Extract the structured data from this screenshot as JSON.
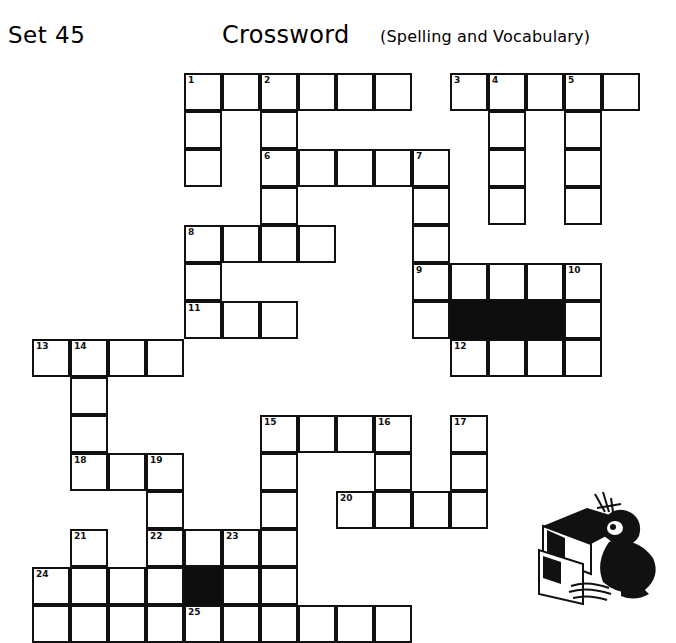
{
  "header": {
    "set_label": "Set 45",
    "title": "Crossword",
    "subtitle": "(Spelling and Vocabulary)"
  },
  "grid": {
    "cell_size": 38,
    "origin_x": 32,
    "origin_y": 73,
    "columns": 16,
    "rows": 15,
    "colors": {
      "cell_fill": "#ffffff",
      "cell_border": "#111111",
      "blocked_fill": "#0d0d0d",
      "page_background": "#ffffff"
    },
    "clue_numbers": [
      1,
      2,
      3,
      4,
      5,
      6,
      7,
      8,
      9,
      10,
      11,
      12,
      13,
      14,
      15,
      16,
      17,
      18,
      19,
      20,
      21,
      22,
      23,
      24,
      25
    ],
    "cells": [
      {
        "col": 4,
        "row": 0,
        "num": "1"
      },
      {
        "col": 5,
        "row": 0,
        "num": ""
      },
      {
        "col": 6,
        "row": 0,
        "num": "2"
      },
      {
        "col": 7,
        "row": 0,
        "num": ""
      },
      {
        "col": 8,
        "row": 0,
        "num": ""
      },
      {
        "col": 9,
        "row": 0,
        "num": ""
      },
      {
        "col": 11,
        "row": 0,
        "num": "3"
      },
      {
        "col": 12,
        "row": 0,
        "num": "4"
      },
      {
        "col": 13,
        "row": 0,
        "num": ""
      },
      {
        "col": 14,
        "row": 0,
        "num": "5"
      },
      {
        "col": 15,
        "row": 0,
        "num": ""
      },
      {
        "col": 4,
        "row": 1,
        "num": ""
      },
      {
        "col": 6,
        "row": 1,
        "num": ""
      },
      {
        "col": 12,
        "row": 1,
        "num": ""
      },
      {
        "col": 14,
        "row": 1,
        "num": ""
      },
      {
        "col": 4,
        "row": 2,
        "num": ""
      },
      {
        "col": 6,
        "row": 2,
        "num": "6"
      },
      {
        "col": 7,
        "row": 2,
        "num": ""
      },
      {
        "col": 8,
        "row": 2,
        "num": ""
      },
      {
        "col": 9,
        "row": 2,
        "num": ""
      },
      {
        "col": 10,
        "row": 2,
        "num": "7"
      },
      {
        "col": 12,
        "row": 2,
        "num": ""
      },
      {
        "col": 14,
        "row": 2,
        "num": ""
      },
      {
        "col": 6,
        "row": 3,
        "num": ""
      },
      {
        "col": 10,
        "row": 3,
        "num": ""
      },
      {
        "col": 12,
        "row": 3,
        "num": ""
      },
      {
        "col": 14,
        "row": 3,
        "num": ""
      },
      {
        "col": 4,
        "row": 4,
        "num": "8"
      },
      {
        "col": 5,
        "row": 4,
        "num": ""
      },
      {
        "col": 6,
        "row": 4,
        "num": ""
      },
      {
        "col": 7,
        "row": 4,
        "num": ""
      },
      {
        "col": 10,
        "row": 4,
        "num": ""
      },
      {
        "col": 4,
        "row": 5,
        "num": ""
      },
      {
        "col": 10,
        "row": 5,
        "num": "9"
      },
      {
        "col": 11,
        "row": 5,
        "num": ""
      },
      {
        "col": 12,
        "row": 5,
        "num": ""
      },
      {
        "col": 13,
        "row": 5,
        "num": ""
      },
      {
        "col": 14,
        "row": 5,
        "num": "10"
      },
      {
        "col": 4,
        "row": 6,
        "num": "11"
      },
      {
        "col": 5,
        "row": 6,
        "num": ""
      },
      {
        "col": 6,
        "row": 6,
        "num": ""
      },
      {
        "col": 10,
        "row": 6,
        "num": ""
      },
      {
        "col": 11,
        "row": 6,
        "num": "",
        "black": true
      },
      {
        "col": 12,
        "row": 6,
        "num": "",
        "black": true
      },
      {
        "col": 13,
        "row": 6,
        "num": "",
        "black": true
      },
      {
        "col": 14,
        "row": 6,
        "num": ""
      },
      {
        "col": 0,
        "row": 7,
        "num": "13"
      },
      {
        "col": 1,
        "row": 7,
        "num": "14"
      },
      {
        "col": 2,
        "row": 7,
        "num": ""
      },
      {
        "col": 3,
        "row": 7,
        "num": ""
      },
      {
        "col": 11,
        "row": 7,
        "num": "12"
      },
      {
        "col": 12,
        "row": 7,
        "num": ""
      },
      {
        "col": 13,
        "row": 7,
        "num": ""
      },
      {
        "col": 14,
        "row": 7,
        "num": ""
      },
      {
        "col": 1,
        "row": 8,
        "num": ""
      },
      {
        "col": 1,
        "row": 9,
        "num": ""
      },
      {
        "col": 6,
        "row": 9,
        "num": "15"
      },
      {
        "col": 7,
        "row": 9,
        "num": ""
      },
      {
        "col": 8,
        "row": 9,
        "num": ""
      },
      {
        "col": 9,
        "row": 9,
        "num": "16"
      },
      {
        "col": 11,
        "row": 9,
        "num": "17"
      },
      {
        "col": 1,
        "row": 10,
        "num": "18"
      },
      {
        "col": 2,
        "row": 10,
        "num": ""
      },
      {
        "col": 3,
        "row": 10,
        "num": "19"
      },
      {
        "col": 6,
        "row": 10,
        "num": ""
      },
      {
        "col": 9,
        "row": 10,
        "num": ""
      },
      {
        "col": 11,
        "row": 10,
        "num": ""
      },
      {
        "col": 3,
        "row": 11,
        "num": ""
      },
      {
        "col": 6,
        "row": 11,
        "num": ""
      },
      {
        "col": 8,
        "row": 11,
        "num": "20"
      },
      {
        "col": 9,
        "row": 11,
        "num": ""
      },
      {
        "col": 10,
        "row": 11,
        "num": ""
      },
      {
        "col": 11,
        "row": 11,
        "num": ""
      },
      {
        "col": 1,
        "row": 12,
        "num": "21"
      },
      {
        "col": 3,
        "row": 12,
        "num": "22"
      },
      {
        "col": 4,
        "row": 12,
        "num": ""
      },
      {
        "col": 5,
        "row": 12,
        "num": "23"
      },
      {
        "col": 6,
        "row": 12,
        "num": ""
      },
      {
        "col": 0,
        "row": 13,
        "num": "24"
      },
      {
        "col": 1,
        "row": 13,
        "num": ""
      },
      {
        "col": 2,
        "row": 13,
        "num": ""
      },
      {
        "col": 3,
        "row": 13,
        "num": ""
      },
      {
        "col": 4,
        "row": 13,
        "num": "",
        "black": true
      },
      {
        "col": 5,
        "row": 13,
        "num": ""
      },
      {
        "col": 6,
        "row": 13,
        "num": ""
      },
      {
        "col": 0,
        "row": 14,
        "num": ""
      },
      {
        "col": 1,
        "row": 14,
        "num": ""
      },
      {
        "col": 2,
        "row": 14,
        "num": ""
      },
      {
        "col": 3,
        "row": 14,
        "num": ""
      },
      {
        "col": 4,
        "row": 14,
        "num": "25"
      },
      {
        "col": 5,
        "row": 14,
        "num": ""
      },
      {
        "col": 6,
        "row": 14,
        "num": ""
      },
      {
        "col": 7,
        "row": 14,
        "num": ""
      },
      {
        "col": 8,
        "row": 14,
        "num": ""
      },
      {
        "col": 9,
        "row": 14,
        "num": ""
      }
    ]
  },
  "illustration": {
    "name": "student-at-desk-drawing",
    "description": "Line drawing of a person seated at a desk writing"
  }
}
